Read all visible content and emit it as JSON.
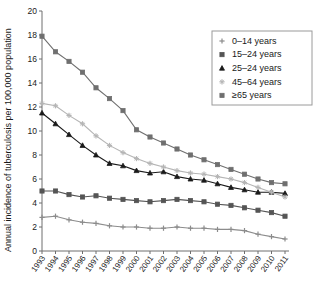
{
  "chart_data": {
    "type": "line",
    "title": "",
    "xlabel": "",
    "ylabel": "Annual incidence of tuberculosis per 100,000 population",
    "ylim": [
      0,
      20
    ],
    "ytick_labels": [
      "0",
      "2",
      "4",
      "6",
      "8",
      "10",
      "12",
      "14",
      "16",
      "18",
      "20"
    ],
    "ytick_values": [
      0,
      2,
      4,
      6,
      8,
      10,
      12,
      14,
      16,
      18,
      20
    ],
    "grid": false,
    "legend_position": "top-right",
    "categories": [
      "1993",
      "1994",
      "1995",
      "1996",
      "1997",
      "1998",
      "1999",
      "2000",
      "2001",
      "2002",
      "2003",
      "2004",
      "2005",
      "2006",
      "2007",
      "2008",
      "2009",
      "2010",
      "2011"
    ],
    "x": [
      1993,
      1994,
      1995,
      1996,
      1997,
      1998,
      1999,
      2000,
      2001,
      2002,
      2003,
      2004,
      2005,
      2006,
      2007,
      2008,
      2009,
      2010,
      2011
    ],
    "series": [
      {
        "name": "0–14 years",
        "marker": "plus",
        "color": "#8c8c8c",
        "values": [
          2.8,
          2.9,
          2.6,
          2.4,
          2.3,
          2.1,
          2.0,
          2.0,
          1.9,
          1.9,
          2.0,
          1.9,
          1.9,
          1.8,
          1.8,
          1.7,
          1.4,
          1.2,
          1.0
        ]
      },
      {
        "name": "15–24 years",
        "marker": "square",
        "color": "#555555",
        "values": [
          5.0,
          5.0,
          4.7,
          4.5,
          4.6,
          4.4,
          4.3,
          4.2,
          4.1,
          4.2,
          4.3,
          4.2,
          4.1,
          3.9,
          3.8,
          3.6,
          3.4,
          3.2,
          2.9
        ]
      },
      {
        "name": "25–24 years",
        "marker": "triangle",
        "color": "#1a1a1a",
        "values": [
          11.5,
          10.6,
          9.7,
          8.8,
          8.0,
          7.3,
          7.1,
          6.7,
          6.5,
          6.6,
          6.2,
          6.0,
          5.9,
          5.6,
          5.3,
          5.1,
          4.9,
          4.9,
          4.8
        ]
      },
      {
        "name": "45–64 years",
        "marker": "star",
        "color": "#b5b5b5",
        "values": [
          12.3,
          12.1,
          11.3,
          10.6,
          9.6,
          8.8,
          8.2,
          7.7,
          7.3,
          7.0,
          6.7,
          6.5,
          6.4,
          6.2,
          6.0,
          5.7,
          5.3,
          4.9,
          4.5
        ]
      },
      {
        "name": "≥65 years",
        "marker": "square",
        "color": "#6f6f6f",
        "values": [
          17.9,
          16.6,
          15.8,
          14.9,
          13.6,
          12.7,
          11.7,
          10.1,
          9.5,
          9.0,
          8.5,
          8.0,
          7.6,
          7.2,
          6.8,
          6.4,
          6.0,
          5.7,
          5.6
        ]
      }
    ]
  },
  "legend": {
    "items": [
      {
        "label": "0–14 years"
      },
      {
        "label": "15–24 years"
      },
      {
        "label": "25–24 years"
      },
      {
        "label": "45–64 years"
      },
      {
        "label": "≥65 years"
      }
    ]
  }
}
